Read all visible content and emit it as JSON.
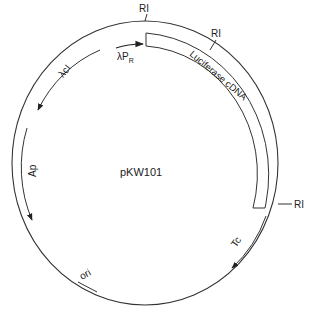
{
  "diagram": {
    "title": "pKW101",
    "plasmid_name": "pKW101",
    "restriction_sites": [
      {
        "label": "RI",
        "position": "top"
      },
      {
        "label": "RI",
        "position": "upper-right"
      },
      {
        "label": "RI",
        "position": "right"
      }
    ],
    "features": [
      {
        "label": "Luciferase cDNA",
        "type": "insert-box"
      },
      {
        "label": "λP",
        "subscript": "R",
        "type": "promoter-arrow"
      },
      {
        "label": "λcI",
        "type": "gene-arrow"
      },
      {
        "label": "Ap",
        "type": "gene-arrow"
      },
      {
        "label": "Tc",
        "type": "gene-arrow"
      },
      {
        "label": "ori",
        "type": "origin"
      }
    ],
    "colors": {
      "line": "#333333",
      "background": "#ffffff"
    }
  }
}
